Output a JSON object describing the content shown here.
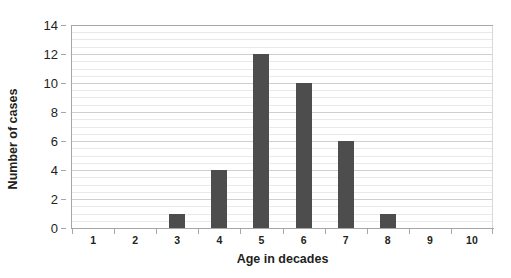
{
  "chart_data": {
    "type": "bar",
    "title": "",
    "subtitle": "",
    "xlabel": "Age in decades",
    "ylabel": "Number of cases",
    "categories": [
      "1",
      "2",
      "3",
      "4",
      "5",
      "6",
      "7",
      "8",
      "9",
      "10"
    ],
    "values": [
      0,
      0,
      1,
      4,
      12,
      10,
      6,
      1,
      0,
      0
    ],
    "series": [
      {
        "name": "Number of cases",
        "values": [
          0,
          0,
          1,
          4,
          12,
          10,
          6,
          1,
          0,
          0
        ]
      }
    ],
    "ylim": [
      0,
      14
    ],
    "xlim": [
      0.5,
      10.5
    ],
    "y_ticks": [
      0,
      2,
      4,
      6,
      8,
      10,
      12,
      14
    ],
    "y_tick_labels": [
      "0",
      "2",
      "4",
      "6",
      "8",
      "10",
      "12",
      "14"
    ],
    "y_minor_tick_step": 0.5,
    "grid": {
      "horizontal_major": true,
      "horizontal_minor": true,
      "vertical": false
    },
    "legend": {
      "visible": false,
      "position": "none",
      "entries": []
    },
    "annotations": [],
    "colors": {
      "bar_fill": "#4d4d4d",
      "gridline_major": "#cfcfcf",
      "gridline_minor": "#e9e9e9",
      "axis_line": "#a6a6a6",
      "text": "#231f20",
      "background": "#ffffff"
    }
  }
}
